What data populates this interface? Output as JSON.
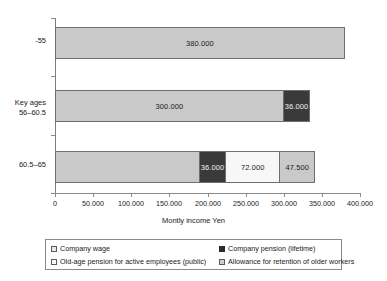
{
  "chart_data": {
    "type": "bar",
    "orientation": "horizontal",
    "stacked": true,
    "title": "",
    "xlabel": "Montly income Yen",
    "ylabel": "",
    "xlim": [
      0,
      400000
    ],
    "grid": false,
    "legend_position": "bottom",
    "categories": [
      "-55",
      "Key ages\n56–60.5",
      "60.5–65"
    ],
    "category_labels": [
      {
        "line1": "-55",
        "line2": ""
      },
      {
        "line1": "Key ages",
        "line2": "56–60.5"
      },
      {
        "line1": "60.5–65",
        "line2": ""
      }
    ],
    "xticks": [
      0,
      50000,
      100000,
      150000,
      200000,
      250000,
      300000,
      350000,
      400000
    ],
    "xtick_labels": [
      "0",
      "50.000",
      "100.000",
      "150.000",
      "200.000",
      "250.000",
      "300.000",
      "350.000",
      "400.000"
    ],
    "series": [
      {
        "name": "Company wage",
        "key": "wage",
        "color": "#c9c9c9",
        "values": [
          380000,
          300000,
          190000
        ],
        "labels": [
          "380.000",
          "300.000",
          ""
        ]
      },
      {
        "name": "Company pension (lifetime)",
        "key": "pension",
        "color": "#3a3a3a",
        "values": [
          0,
          36000,
          36000
        ],
        "labels": [
          "",
          "36.000",
          "36.000"
        ]
      },
      {
        "name": "Old-age pension for active employees (public)",
        "key": "oldage",
        "color": "#f7f7f7",
        "values": [
          0,
          0,
          72000
        ],
        "labels": [
          "",
          "",
          "72.000"
        ]
      },
      {
        "name": "Allowance for retention of older workers",
        "key": "allow",
        "color": "#c9c9c9",
        "values": [
          0,
          0,
          47500
        ],
        "labels": [
          "",
          "",
          "47.500"
        ]
      }
    ],
    "bars": [
      {
        "category": "-55",
        "total": 380000,
        "segments": [
          {
            "series": "Company wage",
            "key": "wage",
            "value": 380000,
            "label": "380.000"
          }
        ]
      },
      {
        "category": "Key ages 56-60.5",
        "total": 336000,
        "segments": [
          {
            "series": "Company wage",
            "key": "wage",
            "value": 300000,
            "label": "300.000"
          },
          {
            "series": "Company pension (lifetime)",
            "key": "pension",
            "value": 36000,
            "label": "36.000"
          }
        ]
      },
      {
        "category": "60.5-65",
        "total": 345500,
        "segments": [
          {
            "series": "Company wage",
            "key": "wage",
            "value": 190000,
            "label": ""
          },
          {
            "series": "Company pension (lifetime)",
            "key": "pension",
            "value": 36000,
            "label": "36.000"
          },
          {
            "series": "Old-age pension for active employees (public)",
            "key": "oldage",
            "value": 72000,
            "label": "72.000"
          },
          {
            "series": "Allowance for retention of older workers",
            "key": "allow",
            "value": 47500,
            "label": "47.500"
          }
        ]
      }
    ]
  },
  "axis": {
    "title": "Montly income Yen"
  },
  "legend": {
    "items": [
      {
        "label": "Company wage",
        "key": "wage"
      },
      {
        "label": "Old-age pension for active employees (public)",
        "key": "oldage"
      },
      {
        "label": "Company pension (lifetime)",
        "key": "pension"
      },
      {
        "label": "Allowance for retention of older workers",
        "key": "allow"
      }
    ]
  }
}
